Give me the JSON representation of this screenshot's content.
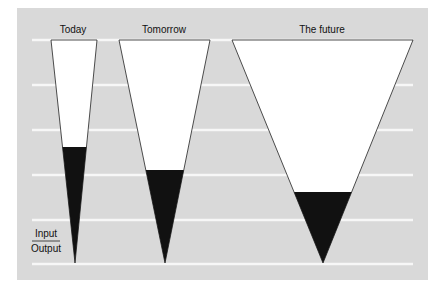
{
  "colors": {
    "panel": "#d9d9d9",
    "line": "#f7f7f7",
    "funnel_fill": "#ffffff",
    "output_fill": "#111111",
    "stroke": "#222222"
  },
  "funnels": [
    {
      "label": "Today",
      "top_left": 51,
      "top_right": 97,
      "tip_x": 75,
      "output_start_y": 147
    },
    {
      "label": "Tomorrow",
      "top_left": 119,
      "top_right": 210,
      "tip_x": 165,
      "output_start_y": 170
    },
    {
      "label": "The future",
      "top_left": 232,
      "top_right": 413,
      "tip_x": 323,
      "output_start_y": 192
    }
  ],
  "legend": {
    "numerator": "Input",
    "denominator": "Output"
  }
}
